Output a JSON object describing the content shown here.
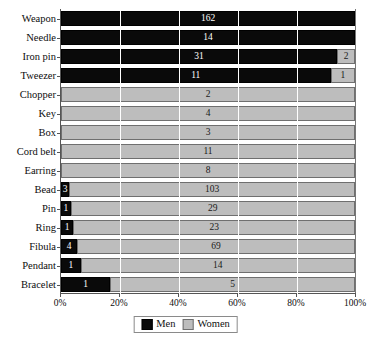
{
  "chart_data": {
    "type": "bar",
    "subtype": "stacked-horizontal-100-percent",
    "title": "",
    "xlabel": "",
    "ylabel": "",
    "xlim": [
      0,
      100
    ],
    "xtick_labels": [
      "0%",
      "20%",
      "40%",
      "60%",
      "80%",
      "100%"
    ],
    "xtick_values": [
      0,
      20,
      40,
      60,
      80,
      100
    ],
    "grid": true,
    "grid_axis": "x",
    "legend_position": "bottom-center",
    "categories": [
      "Weapon",
      "Needle",
      "Iron pin",
      "Tweezer",
      "Chopper",
      "Key",
      "Box",
      "Cord belt",
      "Earring",
      "Bead",
      "Pin",
      "Ring",
      "Fibula",
      "Pendant",
      "Bracelet"
    ],
    "series": [
      {
        "name": "Men",
        "color": "#0a0a0a",
        "values": [
          162,
          14,
          31,
          11,
          0,
          0,
          0,
          0,
          0,
          3,
          1,
          1,
          4,
          1,
          1
        ]
      },
      {
        "name": "Women",
        "color": "#bdbdbd",
        "values": [
          0,
          0,
          2,
          1,
          2,
          4,
          3,
          11,
          8,
          103,
          29,
          23,
          69,
          14,
          5
        ]
      }
    ],
    "rows": [
      {
        "category": "Weapon",
        "men": 162,
        "women": 0,
        "men_pct": 100.0,
        "women_pct": 0.0
      },
      {
        "category": "Needle",
        "men": 14,
        "women": 0,
        "men_pct": 100.0,
        "women_pct": 0.0
      },
      {
        "category": "Iron pin",
        "men": 31,
        "women": 2,
        "men_pct": 93.9,
        "women_pct": 6.1
      },
      {
        "category": "Tweezer",
        "men": 11,
        "women": 1,
        "men_pct": 91.7,
        "women_pct": 8.3
      },
      {
        "category": "Chopper",
        "men": 0,
        "women": 2,
        "men_pct": 0.0,
        "women_pct": 100.0
      },
      {
        "category": "Key",
        "men": 0,
        "women": 4,
        "men_pct": 0.0,
        "women_pct": 100.0
      },
      {
        "category": "Box",
        "men": 0,
        "women": 3,
        "men_pct": 0.0,
        "women_pct": 100.0
      },
      {
        "category": "Cord belt",
        "men": 0,
        "women": 11,
        "men_pct": 0.0,
        "women_pct": 100.0
      },
      {
        "category": "Earring",
        "men": 0,
        "women": 8,
        "men_pct": 0.0,
        "women_pct": 100.0
      },
      {
        "category": "Bead",
        "men": 3,
        "women": 103,
        "men_pct": 2.8,
        "women_pct": 97.2
      },
      {
        "category": "Pin",
        "men": 1,
        "women": 29,
        "men_pct": 3.3,
        "women_pct": 96.7
      },
      {
        "category": "Ring",
        "men": 1,
        "women": 23,
        "men_pct": 4.2,
        "women_pct": 95.8
      },
      {
        "category": "Fibula",
        "men": 4,
        "women": 69,
        "men_pct": 5.5,
        "women_pct": 94.5
      },
      {
        "category": "Pendant",
        "men": 1,
        "women": 14,
        "men_pct": 6.7,
        "women_pct": 93.3
      },
      {
        "category": "Bracelet",
        "men": 1,
        "women": 5,
        "men_pct": 16.7,
        "women_pct": 83.3
      }
    ]
  },
  "legend": {
    "items": [
      {
        "label": "Men",
        "color": "#0a0a0a"
      },
      {
        "label": "Women",
        "color": "#bdbdbd"
      }
    ]
  }
}
